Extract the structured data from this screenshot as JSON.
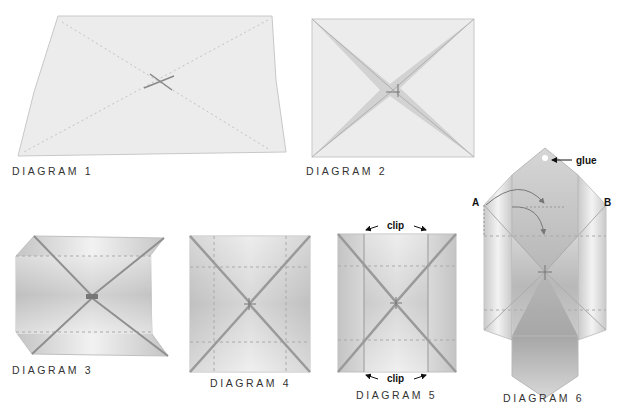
{
  "captions": {
    "d1": "DIAGRAM 1",
    "d2": "DIAGRAM 2",
    "d3": "DIAGRAM 3",
    "d4": "DIAGRAM 4",
    "d5": "DIAGRAM 5",
    "d6": "DIAGRAM 6"
  },
  "annotations": {
    "clip_top": "clip",
    "clip_bottom": "clip",
    "glue": "glue",
    "point_a": "A",
    "point_b": "B"
  },
  "colors": {
    "paper": "#ececec",
    "edge": "#c8c8c8",
    "fold_line": "#b8b8b8",
    "shade": "#9a9a9a",
    "text": "#333333"
  }
}
